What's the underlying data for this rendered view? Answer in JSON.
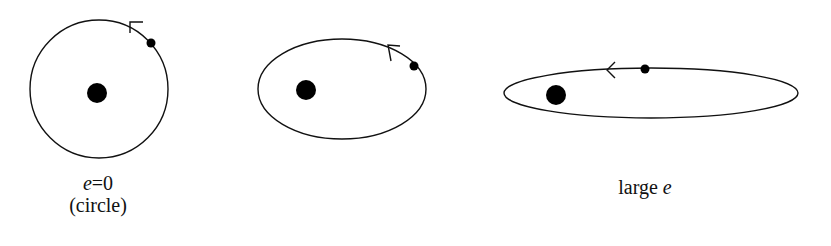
{
  "diagrams": [
    {
      "id": "circle-orbit",
      "label_var": "e",
      "label_rest": "=0",
      "label_sub": "(circle)"
    },
    {
      "id": "moderate-ellipse-orbit"
    },
    {
      "id": "large-ellipse-orbit",
      "label_pre": "large ",
      "label_var": "e"
    }
  ],
  "colors": {
    "stroke": "#111111",
    "fill": "#000000",
    "background": "#ffffff"
  }
}
